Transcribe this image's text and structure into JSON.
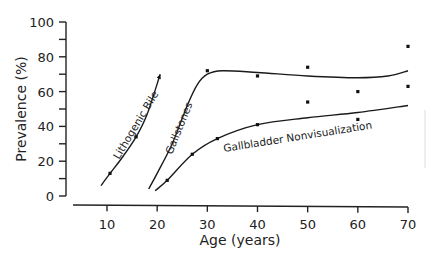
{
  "chart_data": {
    "type": "line",
    "title": "",
    "xlabel": "Age (years)",
    "ylabel": "Prevalence (%)",
    "xlim": [
      4,
      71
    ],
    "ylim": [
      0,
      100
    ],
    "x_ticks": [
      10,
      20,
      30,
      40,
      50,
      60,
      70
    ],
    "x_tick_labels": [
      "10",
      "20",
      "30",
      "40",
      "50",
      "60",
      "70"
    ],
    "y_ticks": [
      0,
      10,
      20,
      30,
      40,
      50,
      60,
      70,
      80,
      90,
      100
    ],
    "y_tick_labels": [
      "0",
      "20",
      "40",
      "60",
      "80",
      "100"
    ],
    "grid": false,
    "legend": "none (curves labeled inline)",
    "series": [
      {
        "name": "Lithogenic Bile",
        "curve": [
          [
            8.8,
            6
          ],
          [
            10.6,
            13
          ],
          [
            13,
            22
          ],
          [
            15.8,
            34
          ],
          [
            18,
            47
          ],
          [
            20.6,
            70
          ]
        ],
        "points": [
          [
            10.6,
            13
          ],
          [
            15.8,
            34
          ]
        ],
        "end_arrow": true
      },
      {
        "name": "Gallstones",
        "curve": [
          [
            18.3,
            4
          ],
          [
            20,
            13
          ],
          [
            23,
            30
          ],
          [
            26,
            52
          ],
          [
            28,
            64
          ],
          [
            30,
            70
          ],
          [
            33,
            72
          ],
          [
            40,
            71
          ],
          [
            50,
            69
          ],
          [
            60,
            68
          ],
          [
            66,
            69
          ],
          [
            70,
            72
          ]
        ],
        "points": [
          [
            30,
            72
          ],
          [
            40,
            69
          ],
          [
            50,
            74
          ],
          [
            60,
            60
          ],
          [
            70,
            86
          ]
        ]
      },
      {
        "name": "Gallbladder Nonvisualization",
        "curve": [
          [
            19.6,
            3
          ],
          [
            22,
            9
          ],
          [
            27,
            24
          ],
          [
            32,
            33
          ],
          [
            40,
            41
          ],
          [
            50,
            45
          ],
          [
            60,
            48
          ],
          [
            70,
            52
          ]
        ],
        "points": [
          [
            22,
            9
          ],
          [
            27,
            24
          ],
          [
            32,
            33
          ],
          [
            40,
            41
          ],
          [
            50,
            54
          ],
          [
            60,
            44
          ],
          [
            70,
            63
          ]
        ]
      }
    ]
  },
  "labels": {
    "lithogenic": "Lithogenic Bile",
    "gallstones": "Gallstones",
    "nonvis": "Gallbladder Nonvisualization"
  }
}
